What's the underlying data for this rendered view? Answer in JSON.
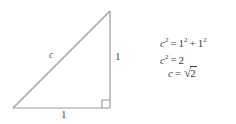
{
  "figure": {
    "line_color": "#999999",
    "text_color": "#3c3c3c",
    "background": "#ffffff",
    "width": 236,
    "height": 124
  },
  "triangle": {
    "vertices": {
      "apex": [
        110,
        11
      ],
      "bottom_left": [
        13,
        108
      ],
      "bottom_right": [
        110,
        108
      ]
    },
    "right_angle_marker": {
      "corner": "bottom-right",
      "size": 8
    },
    "labels": {
      "hypotenuse": "c",
      "vertical_leg": "1",
      "horizontal_leg": "1"
    }
  },
  "equations": {
    "line1": {
      "lhs_var": "c",
      "lhs_exp": "2",
      "equals": "=",
      "term1_base": "1",
      "term1_exp": "2",
      "plus": "+",
      "term2_base": "1",
      "term2_exp": "2",
      "plain": "c² = 1² + 1²"
    },
    "line2": {
      "lhs_var": "c",
      "lhs_exp": "2",
      "equals": "=",
      "rhs": "2",
      "plain": "c² = 2"
    },
    "line3": {
      "lhs_var": "c",
      "equals": "=",
      "radical_sign": "√",
      "radicand": "2",
      "plain": "c = √2"
    }
  }
}
